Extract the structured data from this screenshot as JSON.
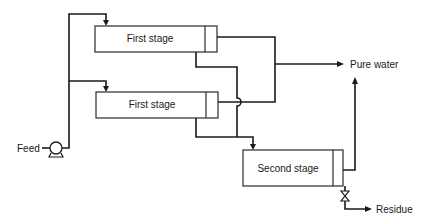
{
  "diagram": {
    "type": "process-flow",
    "title": "",
    "units": [
      {
        "id": "stage1a",
        "label": "First stage"
      },
      {
        "id": "stage1b",
        "label": "First stage"
      },
      {
        "id": "stage2",
        "label": "Second stage"
      }
    ],
    "streams": {
      "feed": "Feed",
      "pure_water": "Pure water",
      "residue": "Residue"
    },
    "equipment": {
      "pump": "pump-icon",
      "valve": "valve-icon"
    },
    "connections": [
      {
        "from": "feed",
        "to": "stage1a"
      },
      {
        "from": "feed",
        "to": "stage1b"
      },
      {
        "from": "stage1a",
        "to": "pure_water",
        "stream": "permeate"
      },
      {
        "from": "stage1b",
        "to": "pure_water",
        "stream": "permeate"
      },
      {
        "from": "stage1a",
        "to": "stage2",
        "stream": "concentrate"
      },
      {
        "from": "stage1b",
        "to": "stage2",
        "stream": "concentrate"
      },
      {
        "from": "stage2",
        "to": "pure_water",
        "stream": "permeate"
      },
      {
        "from": "stage2",
        "to": "residue",
        "stream": "concentrate"
      }
    ]
  }
}
